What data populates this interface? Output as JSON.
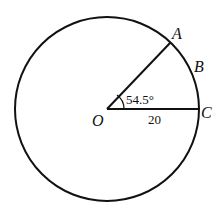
{
  "diagram": {
    "type": "circle-sector",
    "center_label": "O",
    "points": [
      {
        "label": "A"
      },
      {
        "label": "B"
      },
      {
        "label": "C"
      }
    ],
    "angle_label": "54.5°",
    "radius_label": "20",
    "angle_degrees": 54.5,
    "radius_value": 20
  }
}
